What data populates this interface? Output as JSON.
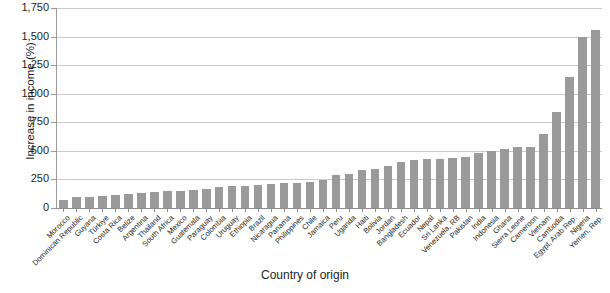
{
  "chart_data": {
    "type": "bar",
    "title": "",
    "xlabel": "Country of origin",
    "ylabel": "Increase in income (%)",
    "ylim": [
      0,
      1750
    ],
    "ytick_step": 250,
    "grid": true,
    "legend": "none",
    "bar_color": "#9a9a9a",
    "yticks": [
      "0",
      "250",
      "500",
      "750",
      "1,000",
      "1,250",
      "1,500",
      "1,750"
    ],
    "categories": [
      "Morocco",
      "Dominican Republic",
      "Guyana",
      "Türkiye",
      "Costa Rica",
      "Belize",
      "Argentina",
      "Thailand",
      "South Africa",
      "Mexico",
      "Guatemala",
      "Paraguay",
      "Colombia",
      "Uruguay",
      "Ethiopia",
      "Brazil",
      "Nicaragua",
      "Panama",
      "Philippines",
      "Chile",
      "Jamaica",
      "Peru",
      "Uganda",
      "Haiti",
      "Bolivia",
      "Jordan",
      "Bangladesh",
      "Ecuador",
      "Nepal",
      "Sri Lanka",
      "Venezuela, RB",
      "Pakistan",
      "India",
      "Indonesia",
      "Ghana",
      "Sierra Leone",
      "Cameroon",
      "Vietnam",
      "Cambodia",
      "Egypt, Arab Rep.",
      "Nigeria",
      "Yemen, Rep."
    ],
    "values": [
      70,
      100,
      100,
      105,
      115,
      125,
      135,
      140,
      145,
      150,
      160,
      170,
      180,
      190,
      195,
      200,
      210,
      215,
      220,
      230,
      245,
      290,
      300,
      330,
      345,
      370,
      400,
      420,
      425,
      430,
      435,
      450,
      480,
      500,
      515,
      530,
      535,
      650,
      840,
      1150,
      1500,
      1555
    ]
  }
}
